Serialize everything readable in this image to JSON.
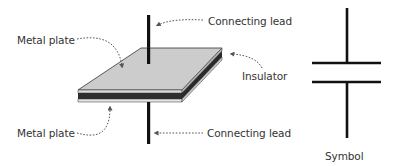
{
  "diagram": {
    "labels": {
      "metal_plate_top": "Metal plate",
      "metal_plate_bottom": "Metal plate",
      "connecting_lead_top": "Connecting lead",
      "connecting_lead_bottom": "Connecting lead",
      "insulator": "Insulator",
      "symbol": "Symbol"
    },
    "colors": {
      "plate_top_face": "#c8c8c8",
      "plate_edge_dark": "#2a2a2a",
      "insulator_band": "#b0b0b0",
      "lead": "#111111",
      "leader_line": "#555555",
      "text": "#333333"
    }
  }
}
